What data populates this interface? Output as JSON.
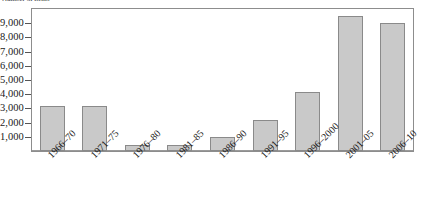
{
  "caption": {
    "text": "Number of items"
  },
  "chart_data": {
    "type": "bar",
    "title": "",
    "subtitle": "",
    "xlabel": "",
    "ylabel": "",
    "categories": [
      "1966–70",
      "1971–75",
      "1976–80",
      "1981–85",
      "1986–90",
      "1991–95",
      "1996–2000",
      "2001–05",
      "2006–10"
    ],
    "values": [
      3150,
      3200,
      450,
      400,
      1000,
      2150,
      4150,
      9500,
      9050
    ],
    "ylim": [
      0,
      10000
    ],
    "ytick_values": [
      1000,
      2000,
      3000,
      4000,
      5000,
      6000,
      7000,
      8000,
      9000
    ],
    "ytick_labels": [
      "1,000",
      "2,000",
      "3,000",
      "4,000",
      "5,000",
      "6,000",
      "7,000",
      "8,000",
      "9,000"
    ],
    "grid": false,
    "legend": null,
    "legend_position": "none",
    "bar_fill_color": "#c9c9c9",
    "bar_border_color": "#8a8a8a",
    "axis_color": "#8d8d8d",
    "text_color": "#1a1a1a",
    "background_color": "#ffffff",
    "xlabel_rotation": -45
  }
}
